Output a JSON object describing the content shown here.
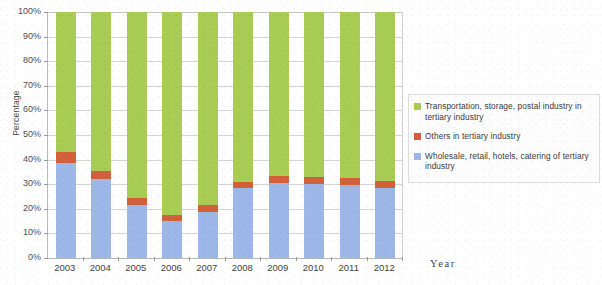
{
  "chart_data": {
    "type": "bar",
    "stacked": true,
    "title": "",
    "xlabel": "Year",
    "ylabel": "Percentage",
    "categories": [
      "2003",
      "2004",
      "2005",
      "2006",
      "2007",
      "2008",
      "2009",
      "2010",
      "2011",
      "2012"
    ],
    "ylim": [
      0,
      100
    ],
    "ytick_labels": [
      "0%",
      "10%",
      "20%",
      "30%",
      "40%",
      "50%",
      "60%",
      "70%",
      "80%",
      "90%",
      "100%"
    ],
    "ytick_values": [
      0,
      10,
      20,
      30,
      40,
      50,
      60,
      70,
      80,
      90,
      100
    ],
    "grid": true,
    "legend_position": "right",
    "series": [
      {
        "name": "Wholesale, retail, hotels, catering of tertiary industry",
        "color": "#9db8e8",
        "values": [
          38.5,
          32.0,
          21.5,
          15.0,
          18.5,
          28.5,
          30.5,
          30.0,
          29.5,
          28.5
        ]
      },
      {
        "name": "Others in tertiary industry",
        "color": "#d2603a",
        "values": [
          4.5,
          3.5,
          3.0,
          2.5,
          3.0,
          2.5,
          3.0,
          3.0,
          3.0,
          3.0
        ]
      },
      {
        "name": "Transportation, storage, postal industry in tertiary industry",
        "color": "#a9cc55",
        "values": [
          57.0,
          64.5,
          75.5,
          82.5,
          78.5,
          69.0,
          66.5,
          67.0,
          67.5,
          68.5
        ]
      }
    ]
  },
  "axes": {
    "y_title": "Percentage",
    "x_title": "Year"
  },
  "legend": {
    "items": [
      {
        "label": "Transportation, storage, postal industry in tertiary industry",
        "color": "#a9cc55"
      },
      {
        "label": "Others in tertiary industry",
        "color": "#d2603a"
      },
      {
        "label": "Wholesale, retail, hotels, catering of tertiary industry",
        "color": "#9db8e8"
      }
    ]
  }
}
